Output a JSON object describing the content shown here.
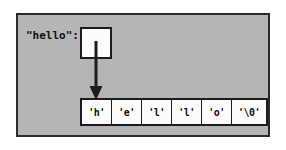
{
  "diagram": {
    "panel": {
      "background_color": "#b5b5b5",
      "border_color": "#2b2b2b"
    },
    "pointer": {
      "label": "\"hello\":",
      "box_value": "",
      "box_fill": "#fbfbfb",
      "arrow_color": "#1c1c1c",
      "arrow_direction": "down"
    },
    "array": {
      "name": "character-array",
      "cell_fill": "#fbfbfb",
      "cell_border": "#1c1c1c",
      "cells": [
        {
          "value": "'h'",
          "wide": false
        },
        {
          "value": "'e'",
          "wide": false
        },
        {
          "value": "'l'",
          "wide": false
        },
        {
          "value": "'l'",
          "wide": false
        },
        {
          "value": "'o'",
          "wide": false
        },
        {
          "value": "'\\0'",
          "wide": true
        }
      ]
    }
  }
}
